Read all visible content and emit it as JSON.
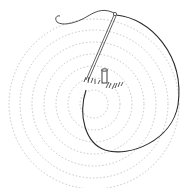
{
  "illustration": {
    "subject": "sketch of a circular lawn with a stake and a rope",
    "colors": {
      "background": "#ffffff",
      "grass": "#b8b8b8",
      "ink": "#2a2a2a"
    },
    "elements": [
      {
        "name": "grass-circle",
        "cx": 94,
        "cy": 103,
        "r": 86
      },
      {
        "name": "stake",
        "x": 103,
        "y": 69
      },
      {
        "name": "pole",
        "from": [
          86,
          80
        ],
        "to": [
          115,
          14
        ]
      },
      {
        "name": "rope-loop",
        "description": "curved line from pole top around right side back to center"
      }
    ]
  }
}
